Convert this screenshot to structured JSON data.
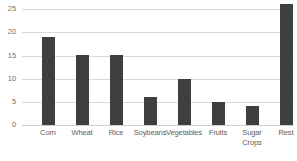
{
  "chart_data": {
    "type": "bar",
    "title": "",
    "subtitle": "",
    "xlabel": "",
    "ylabel": "",
    "categories": [
      "Corn",
      "Wheat",
      "Rice",
      "Soybeans",
      "Vegetables",
      "Fruits",
      "Sugar Crops",
      "Rest"
    ],
    "category_lines": [
      [
        "Corn"
      ],
      [
        "Wheat"
      ],
      [
        "Rice"
      ],
      [
        "Soybeans"
      ],
      [
        "Vegetables"
      ],
      [
        "Fruits"
      ],
      [
        "Sugar",
        "Crops"
      ],
      [
        "Rest"
      ]
    ],
    "values": [
      19,
      15,
      15,
      6,
      10,
      5,
      4,
      26
    ],
    "ylim": [
      0,
      25
    ],
    "yticks": [
      0,
      5,
      10,
      15,
      20,
      25
    ],
    "ytick_labels": [
      "0",
      "5",
      "10",
      "15",
      "20",
      "25"
    ],
    "grid": true,
    "grid_axis": "y",
    "legend": false,
    "legend_position": "none",
    "bar_color": "#3f3f3f",
    "grid_color": "#d9d9d9",
    "tick_label_color": "#6f6f6f",
    "background_color": "#ffffff"
  }
}
